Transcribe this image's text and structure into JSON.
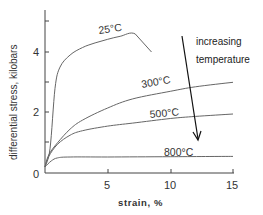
{
  "chart_data": {
    "type": "line",
    "title": "",
    "xlabel": "strain, %",
    "ylabel": "differential stress, kilobars",
    "xlim": [
      0,
      15
    ],
    "ylim": [
      0,
      5.4
    ],
    "x_ticks": [
      0,
      5,
      10,
      15
    ],
    "x_tick_labels": [
      "5",
      "10",
      "15"
    ],
    "y_ticks_major": [
      0,
      2,
      4
    ],
    "y_ticks_minor": [
      1,
      3,
      5
    ],
    "y_tick_labels": [
      "0",
      "2",
      "4"
    ],
    "grid": false,
    "series": [
      {
        "name": "25°C",
        "label": "25°C",
        "points": [
          [
            0,
            0.2
          ],
          [
            0.4,
            0.8
          ],
          [
            0.8,
            2.8
          ],
          [
            1.2,
            3.5
          ],
          [
            2,
            3.9
          ],
          [
            3,
            4.15
          ],
          [
            4,
            4.3
          ],
          [
            5,
            4.42
          ],
          [
            6,
            4.52
          ],
          [
            7.2,
            4.6
          ],
          [
            8.5,
            4.0
          ]
        ]
      },
      {
        "name": "300°C",
        "label": "300°C",
        "points": [
          [
            0,
            0.2
          ],
          [
            0.3,
            0.6
          ],
          [
            1,
            1.0
          ],
          [
            2,
            1.45
          ],
          [
            3,
            1.75
          ],
          [
            5,
            2.15
          ],
          [
            7,
            2.45
          ],
          [
            10,
            2.7
          ],
          [
            12,
            2.85
          ],
          [
            15,
            3.0
          ]
        ]
      },
      {
        "name": "500°C",
        "label": "500°C",
        "points": [
          [
            0,
            0.2
          ],
          [
            0.3,
            0.55
          ],
          [
            1,
            0.95
          ],
          [
            2,
            1.25
          ],
          [
            3,
            1.4
          ],
          [
            5,
            1.55
          ],
          [
            7,
            1.65
          ],
          [
            10,
            1.8
          ],
          [
            12,
            1.87
          ],
          [
            15,
            1.95
          ]
        ]
      },
      {
        "name": "800°C",
        "label": "800°C",
        "points": [
          [
            0,
            0.2
          ],
          [
            0.5,
            0.4
          ],
          [
            1,
            0.5
          ],
          [
            2,
            0.53
          ],
          [
            5,
            0.53
          ],
          [
            10,
            0.54
          ],
          [
            15,
            0.55
          ]
        ]
      }
    ],
    "annotations": [
      {
        "text": "increasing",
        "type": "arrow-label"
      },
      {
        "text": "temperature",
        "type": "arrow-label"
      }
    ],
    "arrow": {
      "from": [
        11.1,
        5.0
      ],
      "to": [
        12.5,
        1.0
      ],
      "meaning": "increasing temperature"
    }
  },
  "labels": {
    "ylabel": "differential stress, kilobars",
    "xlabel": "strain, %",
    "x5": "5",
    "x10": "10",
    "x15": "15",
    "y0": "0",
    "y2": "2",
    "y4": "4",
    "t25": "25°C",
    "t300": "300°C",
    "t500": "500°C",
    "t800": "800°C",
    "anno1": "increasing",
    "anno2": "temperature"
  }
}
